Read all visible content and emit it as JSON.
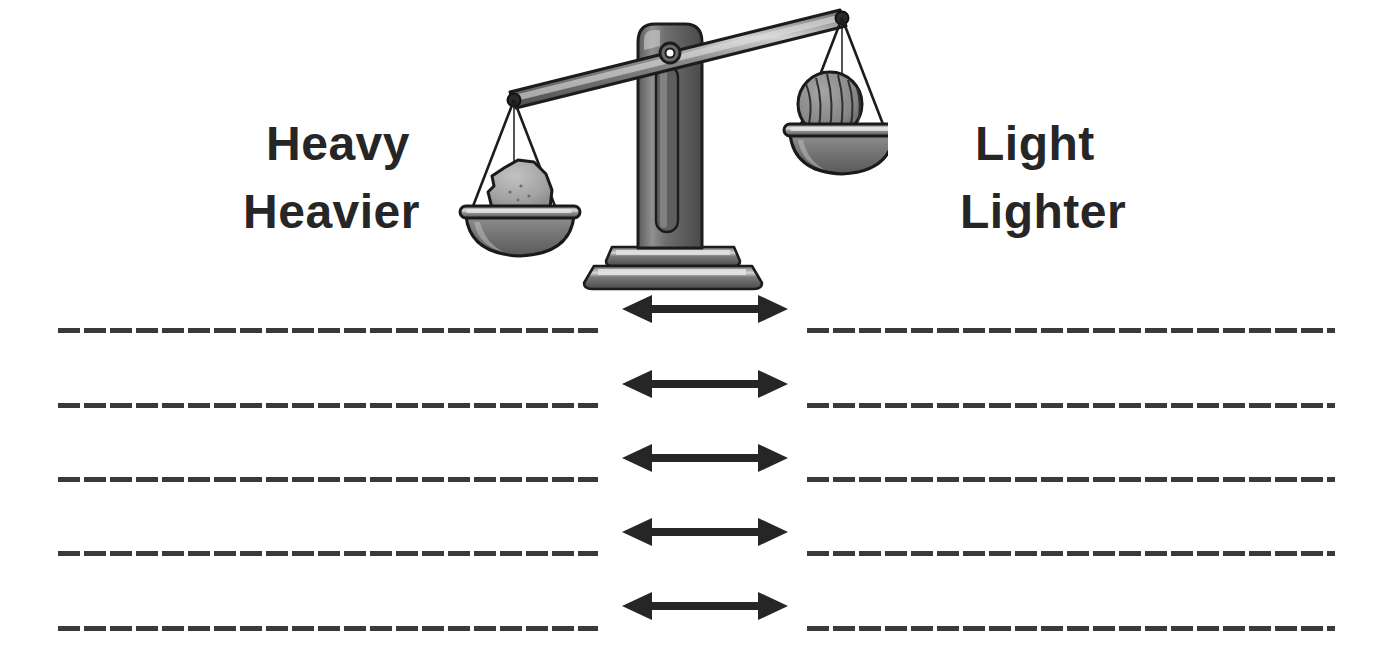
{
  "page": {
    "background_color": "#ffffff",
    "width": 1395,
    "height": 671
  },
  "labels": {
    "left_top": "Heavy",
    "left_bottom": "Heavier",
    "right_top": "Light",
    "right_bottom": "Lighter",
    "text_color": "#262626"
  },
  "illustration": {
    "name": "balance-scale",
    "description": "Two-pan balance scale tipped to the left",
    "left_pan_item": "rock",
    "right_pan_item": "ball-of-yarn",
    "tilt": "left-side-down",
    "colors": {
      "metal_dark": "#555555",
      "metal_mid": "#7d7d7d",
      "metal_light": "#b3b3b3",
      "highlight": "#d9d9d9",
      "outline": "#1a1a1a",
      "rock_fill": "#a8a8a8",
      "yarn_fill": "#8c8c8c"
    }
  },
  "answer_rows": [
    {
      "id": 1,
      "left_line": "",
      "right_line": "",
      "connector": "double-arrow"
    },
    {
      "id": 2,
      "left_line": "",
      "right_line": "",
      "connector": "double-arrow"
    },
    {
      "id": 3,
      "left_line": "",
      "right_line": "",
      "connector": "double-arrow"
    },
    {
      "id": 4,
      "left_line": "",
      "right_line": "",
      "connector": "double-arrow"
    },
    {
      "id": 5,
      "left_line": "",
      "right_line": "",
      "connector": "double-arrow"
    }
  ],
  "geometry": {
    "line_tops": [
      328,
      403,
      477,
      551,
      626
    ],
    "arrow_tops": [
      294,
      369,
      443,
      517,
      591
    ],
    "line_color": "#3a3a3a",
    "arrow_color": "#262626"
  }
}
